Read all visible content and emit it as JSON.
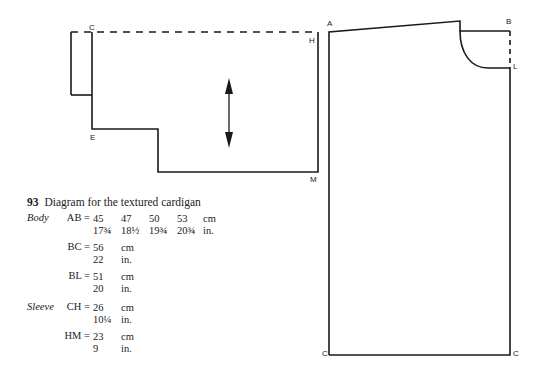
{
  "figure": {
    "number": "93",
    "caption": "Diagram for the textured cardigan"
  },
  "sleeve_diagram": {
    "labels": {
      "C": "C",
      "H": "H",
      "E": "E",
      "M": "M"
    },
    "grain_arrow": "double-headed vertical arrow"
  },
  "body_diagram": {
    "labels": {
      "A": "A",
      "B": "B",
      "L": "L",
      "C_left": "C",
      "C_right": "C"
    }
  },
  "measurements": {
    "body": {
      "section_label": "Body",
      "rows": [
        {
          "key": "AB =",
          "values_cm": [
            "45",
            "47",
            "50",
            "53"
          ],
          "unit_cm": "cm",
          "values_in": [
            "17¾",
            "18½",
            "19¾",
            "20¾"
          ],
          "unit_in": "in."
        },
        {
          "key": "BC =",
          "values_cm": [
            "56"
          ],
          "unit_cm": "cm",
          "values_in": [
            "22"
          ],
          "unit_in": "in."
        },
        {
          "key": "BL =",
          "values_cm": [
            "51"
          ],
          "unit_cm": "cm",
          "values_in": [
            "20"
          ],
          "unit_in": "in."
        }
      ]
    },
    "sleeve": {
      "section_label": "Sleeve",
      "rows": [
        {
          "key": "CH =",
          "values_cm": [
            "26"
          ],
          "unit_cm": "cm",
          "values_in": [
            "10¼"
          ],
          "unit_in": "in."
        },
        {
          "key": "HM =",
          "values_cm": [
            "23"
          ],
          "unit_cm": "cm",
          "values_in": [
            "9"
          ],
          "unit_in": "in."
        }
      ]
    }
  }
}
